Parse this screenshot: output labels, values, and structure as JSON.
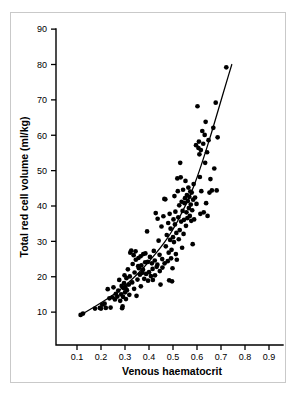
{
  "chart_data": {
    "type": "scatter",
    "title": "",
    "xlabel": "Venous haematocrit",
    "ylabel": "Total red cell volume (ml/kg)",
    "xlim": [
      0.0,
      0.95
    ],
    "ylim": [
      0,
      90
    ],
    "xticks": [
      0.1,
      0.2,
      0.3,
      0.4,
      0.5,
      0.6,
      0.7,
      0.8,
      0.9
    ],
    "xtick_labels": [
      "0.1",
      "0.2",
      "0.3",
      "0.4",
      "0.5",
      "0.6",
      "0.7",
      "0.8",
      "0.9"
    ],
    "yticks": [
      10,
      20,
      30,
      40,
      50,
      60,
      70,
      80,
      90
    ],
    "ytick_labels": [
      "10",
      "20",
      "30",
      "40",
      "50",
      "60",
      "70",
      "80",
      "90"
    ],
    "grid": false,
    "legend": false,
    "marker": "filled-circle",
    "marker_color": "#000000",
    "point_count": 172,
    "points": [
      [
        0.115,
        9.2
      ],
      [
        0.125,
        9.6
      ],
      [
        0.175,
        11.0
      ],
      [
        0.195,
        11.2
      ],
      [
        0.2,
        11.0
      ],
      [
        0.205,
        12.1
      ],
      [
        0.215,
        12.4
      ],
      [
        0.22,
        11.2
      ],
      [
        0.228,
        16.5
      ],
      [
        0.235,
        13.9
      ],
      [
        0.24,
        11.3
      ],
      [
        0.248,
        14.2
      ],
      [
        0.252,
        17.0
      ],
      [
        0.258,
        13.6
      ],
      [
        0.262,
        15.2
      ],
      [
        0.268,
        14.4
      ],
      [
        0.272,
        16.1
      ],
      [
        0.276,
        19.1
      ],
      [
        0.28,
        13.2
      ],
      [
        0.284,
        15.0
      ],
      [
        0.286,
        17.4
      ],
      [
        0.288,
        11.1
      ],
      [
        0.29,
        11.6
      ],
      [
        0.292,
        14.3
      ],
      [
        0.294,
        16.8
      ],
      [
        0.296,
        18.2
      ],
      [
        0.298,
        20.4
      ],
      [
        0.3,
        15.6
      ],
      [
        0.302,
        17.1
      ],
      [
        0.304,
        13.7
      ],
      [
        0.306,
        19.6
      ],
      [
        0.308,
        16.2
      ],
      [
        0.312,
        22.1
      ],
      [
        0.316,
        17.8
      ],
      [
        0.318,
        14.9
      ],
      [
        0.32,
        20.1
      ],
      [
        0.322,
        26.8
      ],
      [
        0.326,
        27.4
      ],
      [
        0.33,
        18.4
      ],
      [
        0.332,
        23.6
      ],
      [
        0.336,
        26.1
      ],
      [
        0.338,
        16.6
      ],
      [
        0.34,
        21.2
      ],
      [
        0.344,
        27.2
      ],
      [
        0.348,
        14.6
      ],
      [
        0.352,
        19.2
      ],
      [
        0.356,
        25.3
      ],
      [
        0.358,
        22.4
      ],
      [
        0.362,
        20.6
      ],
      [
        0.366,
        17.3
      ],
      [
        0.368,
        23.2
      ],
      [
        0.372,
        21.1
      ],
      [
        0.376,
        26.4
      ],
      [
        0.38,
        19.4
      ],
      [
        0.384,
        24.1
      ],
      [
        0.388,
        20.8
      ],
      [
        0.392,
        32.8
      ],
      [
        0.396,
        18.9
      ],
      [
        0.4,
        21.3
      ],
      [
        0.404,
        25.6
      ],
      [
        0.408,
        20.2
      ],
      [
        0.412,
        23.8
      ],
      [
        0.416,
        19.1
      ],
      [
        0.42,
        27.3
      ],
      [
        0.424,
        24.6
      ],
      [
        0.428,
        38.0
      ],
      [
        0.432,
        22.8
      ],
      [
        0.436,
        36.4
      ],
      [
        0.44,
        30.2
      ],
      [
        0.444,
        26.2
      ],
      [
        0.448,
        17.8
      ],
      [
        0.452,
        34.2
      ],
      [
        0.456,
        22.6
      ],
      [
        0.46,
        37.1
      ],
      [
        0.464,
        42.0
      ],
      [
        0.468,
        41.9
      ],
      [
        0.47,
        28.6
      ],
      [
        0.474,
        31.8
      ],
      [
        0.478,
        24.4
      ],
      [
        0.48,
        35.2
      ],
      [
        0.482,
        26.8
      ],
      [
        0.484,
        19.0
      ],
      [
        0.486,
        37.8
      ],
      [
        0.488,
        30.4
      ],
      [
        0.49,
        33.6
      ],
      [
        0.492,
        25.2
      ],
      [
        0.494,
        27.6
      ],
      [
        0.496,
        18.7
      ],
      [
        0.498,
        22.4
      ],
      [
        0.5,
        31.2
      ],
      [
        0.502,
        36.2
      ],
      [
        0.504,
        29.8
      ],
      [
        0.506,
        42.8
      ],
      [
        0.508,
        34.8
      ],
      [
        0.51,
        38.4
      ],
      [
        0.512,
        26.4
      ],
      [
        0.514,
        32.4
      ],
      [
        0.516,
        24.8
      ],
      [
        0.518,
        47.8
      ],
      [
        0.52,
        44.2
      ],
      [
        0.522,
        36.8
      ],
      [
        0.524,
        30.6
      ],
      [
        0.526,
        40.2
      ],
      [
        0.528,
        33.2
      ],
      [
        0.53,
        52.2
      ],
      [
        0.532,
        48.1
      ],
      [
        0.534,
        35.6
      ],
      [
        0.536,
        41.2
      ],
      [
        0.538,
        28.2
      ],
      [
        0.54,
        38.6
      ],
      [
        0.542,
        44.6
      ],
      [
        0.544,
        32.1
      ],
      [
        0.546,
        36.1
      ],
      [
        0.548,
        40.8
      ],
      [
        0.55,
        42.2
      ],
      [
        0.552,
        47.1
      ],
      [
        0.554,
        34.4
      ],
      [
        0.556,
        38.2
      ],
      [
        0.558,
        43.1
      ],
      [
        0.56,
        36.6
      ],
      [
        0.562,
        41.4
      ],
      [
        0.564,
        45.2
      ],
      [
        0.566,
        39.4
      ],
      [
        0.568,
        42.6
      ],
      [
        0.57,
        37.2
      ],
      [
        0.572,
        44.1
      ],
      [
        0.574,
        40.4
      ],
      [
        0.576,
        35.8
      ],
      [
        0.578,
        43.8
      ],
      [
        0.58,
        38.8
      ],
      [
        0.582,
        29.2
      ],
      [
        0.584,
        41.8
      ],
      [
        0.586,
        46.2
      ],
      [
        0.588,
        36.2
      ],
      [
        0.592,
        42.4
      ],
      [
        0.596,
        57.2
      ],
      [
        0.598,
        40.6
      ],
      [
        0.602,
        68.2
      ],
      [
        0.606,
        56.4
      ],
      [
        0.608,
        58.2
      ],
      [
        0.61,
        54.6
      ],
      [
        0.612,
        48.2
      ],
      [
        0.614,
        37.8
      ],
      [
        0.616,
        55.8
      ],
      [
        0.618,
        44.2
      ],
      [
        0.622,
        61.2
      ],
      [
        0.626,
        57.6
      ],
      [
        0.628,
        38.2
      ],
      [
        0.632,
        60.1
      ],
      [
        0.634,
        52.2
      ],
      [
        0.636,
        63.8
      ],
      [
        0.638,
        40.8
      ],
      [
        0.642,
        55.2
      ],
      [
        0.644,
        37.2
      ],
      [
        0.648,
        58.6
      ],
      [
        0.652,
        43.8
      ],
      [
        0.656,
        47.6
      ],
      [
        0.662,
        44.4
      ],
      [
        0.668,
        62.1
      ],
      [
        0.672,
        50.6
      ],
      [
        0.678,
        69.2
      ],
      [
        0.682,
        44.4
      ],
      [
        0.686,
        59.4
      ],
      [
        0.722,
        79.2
      ],
      [
        0.345,
        24.8
      ],
      [
        0.355,
        23.0
      ],
      [
        0.365,
        25.8
      ],
      [
        0.375,
        22.0
      ],
      [
        0.385,
        26.6
      ],
      [
        0.395,
        24.2
      ],
      [
        0.415,
        22.2
      ],
      [
        0.425,
        20.4
      ],
      [
        0.435,
        23.4
      ],
      [
        0.445,
        21.6
      ],
      [
        0.455,
        25.0
      ],
      [
        0.465,
        23.8
      ]
    ],
    "fit_curve": {
      "description": "fitted exponential-like trend line",
      "points": [
        [
          0.112,
          9.0
        ],
        [
          0.15,
          10.6
        ],
        [
          0.2,
          12.6
        ],
        [
          0.25,
          14.8
        ],
        [
          0.3,
          17.4
        ],
        [
          0.35,
          20.6
        ],
        [
          0.4,
          24.2
        ],
        [
          0.45,
          28.4
        ],
        [
          0.48,
          31.2
        ],
        [
          0.5,
          33.4
        ],
        [
          0.52,
          35.8
        ],
        [
          0.54,
          38.6
        ],
        [
          0.56,
          41.2
        ],
        [
          0.58,
          44.4
        ],
        [
          0.6,
          48.0
        ],
        [
          0.62,
          52.0
        ],
        [
          0.64,
          56.2
        ],
        [
          0.66,
          60.6
        ],
        [
          0.68,
          65.2
        ],
        [
          0.7,
          69.8
        ],
        [
          0.72,
          74.4
        ],
        [
          0.745,
          80.0
        ]
      ]
    }
  }
}
